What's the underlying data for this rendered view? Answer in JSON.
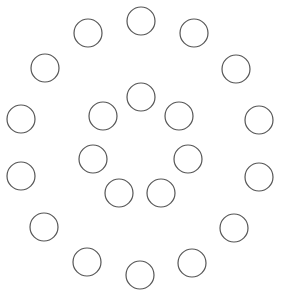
{
  "diagram": {
    "type": "concentric-circle-arrangement",
    "background": "#ffffff",
    "stroke_color": "#555555",
    "circle_radius": 14,
    "outer_ring": [
      {
        "cx": 141,
        "cy": 21
      },
      {
        "cx": 194,
        "cy": 33
      },
      {
        "cx": 236,
        "cy": 69
      },
      {
        "cx": 259,
        "cy": 120
      },
      {
        "cx": 259,
        "cy": 177
      },
      {
        "cx": 234,
        "cy": 228
      },
      {
        "cx": 192,
        "cy": 263
      },
      {
        "cx": 140,
        "cy": 275
      },
      {
        "cx": 87,
        "cy": 262
      },
      {
        "cx": 44,
        "cy": 227
      },
      {
        "cx": 21,
        "cy": 176
      },
      {
        "cx": 21,
        "cy": 119
      },
      {
        "cx": 45,
        "cy": 68
      },
      {
        "cx": 88,
        "cy": 33
      }
    ],
    "inner_ring": [
      {
        "cx": 141,
        "cy": 97
      },
      {
        "cx": 179,
        "cy": 116
      },
      {
        "cx": 188,
        "cy": 159
      },
      {
        "cx": 161,
        "cy": 193
      },
      {
        "cx": 119,
        "cy": 193
      },
      {
        "cx": 93,
        "cy": 159
      },
      {
        "cx": 103,
        "cy": 116
      }
    ]
  }
}
